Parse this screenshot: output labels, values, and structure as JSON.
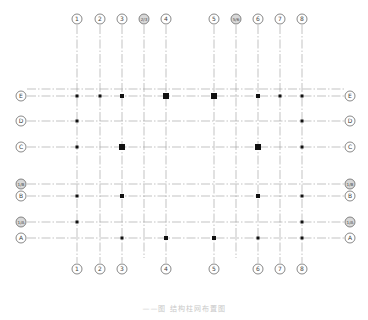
{
  "drawing": {
    "type": "structural-grid-plan",
    "line_color": "#9a9a9a",
    "bubble_color": "#6a6a6a",
    "column_color": "#111111",
    "caption": "——图  结构柱网布置图"
  },
  "columns": [
    {
      "label": "1",
      "x": 77
    },
    {
      "label": "2",
      "x": 100
    },
    {
      "label": "3",
      "x": 122
    },
    {
      "label": "2/3",
      "x": 144,
      "secondary": true,
      "bottom": false
    },
    {
      "label": "4",
      "x": 166
    },
    {
      "label": "5",
      "x": 214
    },
    {
      "label": "5/6",
      "x": 236,
      "secondary": true,
      "bottom": false
    },
    {
      "label": "6",
      "x": 258
    },
    {
      "label": "7",
      "x": 280
    },
    {
      "label": "8",
      "x": 302
    }
  ],
  "rows": [
    {
      "label": "E",
      "y": 96,
      "double": 89
    },
    {
      "label": "D",
      "y": 121
    },
    {
      "label": "C",
      "y": 147
    },
    {
      "label": "1/B",
      "y": 184,
      "secondary": true
    },
    {
      "label": "B",
      "y": 196
    },
    {
      "label": "1/A",
      "y": 222,
      "secondary": true
    },
    {
      "label": "A",
      "y": 238
    }
  ],
  "column_markers": [
    {
      "col": "1",
      "row": "E",
      "size": 3
    },
    {
      "col": "2",
      "row": "E",
      "size": 3
    },
    {
      "col": "3",
      "row": "E",
      "size": 4
    },
    {
      "col": "4",
      "row": "E",
      "size": 6
    },
    {
      "col": "5",
      "row": "E",
      "size": 6
    },
    {
      "col": "6",
      "row": "E",
      "size": 4
    },
    {
      "col": "7",
      "row": "E",
      "size": 3
    },
    {
      "col": "8",
      "row": "E",
      "size": 3
    },
    {
      "col": "1",
      "row": "D",
      "size": 3
    },
    {
      "col": "8",
      "row": "D",
      "size": 3
    },
    {
      "col": "1",
      "row": "C",
      "size": 3
    },
    {
      "col": "3",
      "row": "C",
      "size": 6
    },
    {
      "col": "6",
      "row": "C",
      "size": 6
    },
    {
      "col": "8",
      "row": "C",
      "size": 3
    },
    {
      "col": "1",
      "row": "B",
      "size": 3
    },
    {
      "col": "3",
      "row": "B",
      "size": 4
    },
    {
      "col": "6",
      "row": "B",
      "size": 4
    },
    {
      "col": "8",
      "row": "B",
      "size": 3
    },
    {
      "col": "1",
      "row": "1/A",
      "size": 3
    },
    {
      "col": "8",
      "row": "1/A",
      "size": 3
    },
    {
      "col": "3",
      "row": "A",
      "size": 3
    },
    {
      "col": "4",
      "row": "A",
      "size": 4
    },
    {
      "col": "5",
      "row": "A",
      "size": 4
    },
    {
      "col": "6",
      "row": "A",
      "size": 3
    },
    {
      "col": "8",
      "row": "A",
      "size": 3
    }
  ],
  "layout": {
    "top_bubble_y": 19,
    "bottom_bubble_y": 269,
    "left_bubble_x": 21,
    "right_bubble_x": 350,
    "bubble_r": 5,
    "line_top": 25,
    "line_bottom": 263,
    "line_left": 27,
    "line_right": 344
  }
}
